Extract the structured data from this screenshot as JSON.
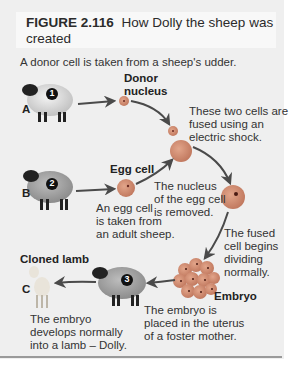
{
  "figure": {
    "number": "FIGURE 2.116",
    "title": "How Dolly the sheep was created"
  },
  "intro": "A donor cell is taken from a sheep's udder.",
  "steps": [
    {
      "letter": "A",
      "number": "1",
      "label": "",
      "caption": ""
    },
    {
      "letter": "B",
      "number": "2",
      "label": "",
      "caption": ""
    },
    {
      "letter": "",
      "number": "3",
      "label": "",
      "caption": ""
    },
    {
      "letter": "C",
      "number": "",
      "label": "Cloned lamb",
      "caption": ""
    }
  ],
  "labels": {
    "donor_nucleus_line1": "Donor",
    "donor_nucleus_line2": "nucleus",
    "egg_cell": "Egg cell",
    "embryo": "Embryo",
    "cloned_lamb": "Cloned lamb"
  },
  "annotations": {
    "fused_1": "These two cells are",
    "fused_2": "fused using an",
    "fused_3": "electric shock.",
    "egg_taken_1": "An egg cell",
    "egg_taken_2": "is taken from",
    "egg_taken_3": "an adult sheep.",
    "nucleus_removed_1": "The nucleus",
    "nucleus_removed_2": "of the egg cell",
    "nucleus_removed_3": "is removed.",
    "dividing_1": "The fused",
    "dividing_2": "cell begins",
    "dividing_3": "dividing",
    "dividing_4": "normally.",
    "placed_1": "The embryo is",
    "placed_2": "placed in the uterus",
    "placed_3": "of a foster mother.",
    "develops_1": "The embryo",
    "develops_2": "develops normally",
    "develops_3": "into a lamb – Dolly."
  },
  "markers": {
    "one": "1",
    "two": "2",
    "three": "3"
  },
  "letters": {
    "a": "A",
    "b": "B",
    "c": "C"
  },
  "colors": {
    "panel": "#efefef",
    "cell": "#cf8a6f",
    "cell_dark": "#b56e58",
    "arrow": "#4a4a4a",
    "text": "#333333"
  }
}
